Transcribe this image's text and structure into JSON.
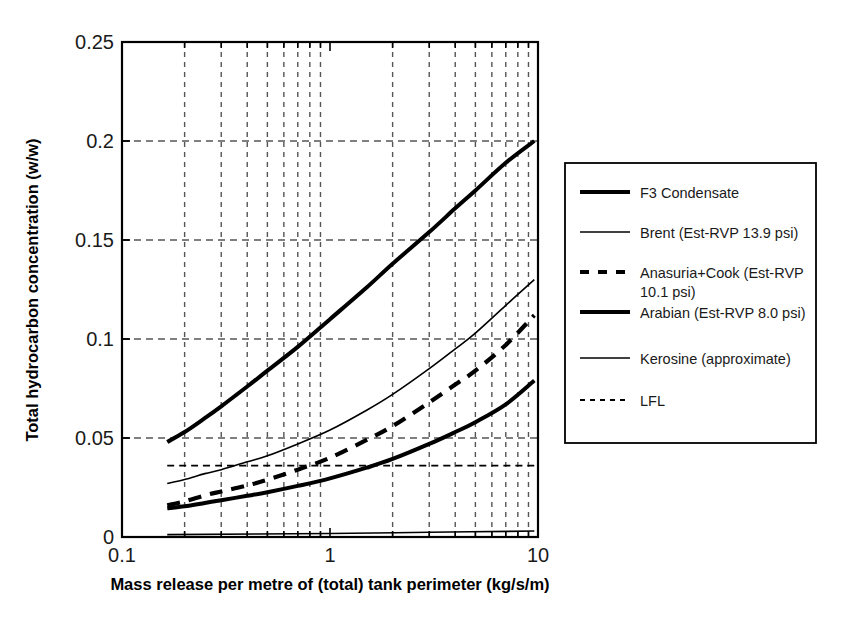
{
  "chart_data": {
    "type": "line",
    "title": "",
    "xlabel": "Mass release per metre of (total) tank perimeter (kg/s/m)",
    "ylabel": "Total hydrocarbon concentration (w/w)",
    "xscale": "log",
    "xlim": [
      0.1,
      10
    ],
    "ylim": [
      0,
      0.25
    ],
    "xticks": [
      "0.1",
      "1",
      "10"
    ],
    "xtick_values": [
      0.1,
      1,
      10
    ],
    "yticks": [
      "0",
      "0.05",
      "0.1",
      "0.15",
      "0.2",
      "0.25"
    ],
    "ytick_values": [
      0,
      0.05,
      0.1,
      0.15,
      0.2,
      0.25
    ],
    "grid": "dashed vertical log-minor and horizontal major",
    "legend_position": "right-outside",
    "series": [
      {
        "name": "F3 Condensate",
        "style": "solid-thick",
        "x": [
          0.165,
          0.2,
          0.25,
          0.3,
          0.4,
          0.5,
          0.7,
          1.0,
          1.5,
          2.0,
          3.0,
          4.0,
          5.0,
          7.0,
          9.6
        ],
        "y": [
          0.048,
          0.053,
          0.06,
          0.066,
          0.076,
          0.084,
          0.096,
          0.11,
          0.126,
          0.138,
          0.154,
          0.166,
          0.175,
          0.189,
          0.2
        ]
      },
      {
        "name": "Brent (Est-RVP 13.9 psi)",
        "style": "solid-thin",
        "x": [
          0.165,
          0.2,
          0.25,
          0.3,
          0.4,
          0.5,
          0.7,
          1.0,
          1.5,
          2.0,
          3.0,
          4.0,
          5.0,
          7.0,
          9.6
        ],
        "y": [
          0.027,
          0.029,
          0.032,
          0.034,
          0.038,
          0.041,
          0.047,
          0.054,
          0.064,
          0.072,
          0.085,
          0.095,
          0.103,
          0.117,
          0.13
        ]
      },
      {
        "name": "Anasuria+Cook (Est-RVP 10.1 psi)",
        "style": "dashed-thick",
        "x": [
          0.165,
          0.2,
          0.25,
          0.3,
          0.4,
          0.5,
          0.7,
          1.0,
          1.5,
          2.0,
          3.0,
          4.0,
          5.0,
          7.0,
          9.6
        ],
        "y": [
          0.016,
          0.018,
          0.021,
          0.023,
          0.026,
          0.029,
          0.034,
          0.04,
          0.049,
          0.056,
          0.068,
          0.077,
          0.084,
          0.097,
          0.112
        ]
      },
      {
        "name": "Arabian (Est-RVP 8.0 psi)",
        "style": "solid-thick",
        "x": [
          0.165,
          0.2,
          0.25,
          0.3,
          0.4,
          0.5,
          0.7,
          1.0,
          1.5,
          2.0,
          3.0,
          4.0,
          5.0,
          7.0,
          9.6
        ],
        "y": [
          0.0145,
          0.0155,
          0.0172,
          0.0186,
          0.0208,
          0.0226,
          0.0258,
          0.0296,
          0.035,
          0.0394,
          0.047,
          0.053,
          0.058,
          0.067,
          0.079
        ]
      },
      {
        "name": "Kerosine (approximate)",
        "style": "solid-thin",
        "x": [
          0.165,
          1.0,
          3.0,
          9.6
        ],
        "y": [
          0.0012,
          0.0018,
          0.0024,
          0.003
        ]
      },
      {
        "name": "LFL",
        "style": "dashed-thin",
        "x": [
          0.165,
          1.0,
          9.6
        ],
        "y": [
          0.036,
          0.036,
          0.036
        ]
      }
    ]
  },
  "legend": {
    "items": [
      {
        "label": "F3 Condensate",
        "style": "solid-thick"
      },
      {
        "label": "Brent (Est-RVP 13.9 psi)",
        "style": "solid-thin"
      },
      {
        "label": "Anasuria+Cook (Est-RVP",
        "label2": "10.1 psi)",
        "style": "dashed-thick"
      },
      {
        "label": "Arabian (Est-RVP 8.0 psi)",
        "style": "solid-thick"
      },
      {
        "label": "Kerosine (approximate)",
        "style": "solid-thin"
      },
      {
        "label": "LFL",
        "style": "dashed-thin"
      }
    ]
  },
  "axes": {
    "x_title": "Mass release per metre of (total) tank perimeter (kg/s/m)",
    "y_title": "Total hydrocarbon concentration (w/w)",
    "x_tick_labels": [
      "0.1",
      "1",
      "10"
    ],
    "y_tick_labels": [
      "0",
      "0.05",
      "0.1",
      "0.15",
      "0.2",
      "0.25"
    ]
  },
  "colors": {
    "line": "#000000",
    "grid": "#555555",
    "axis": "#000000",
    "background": "#ffffff"
  }
}
